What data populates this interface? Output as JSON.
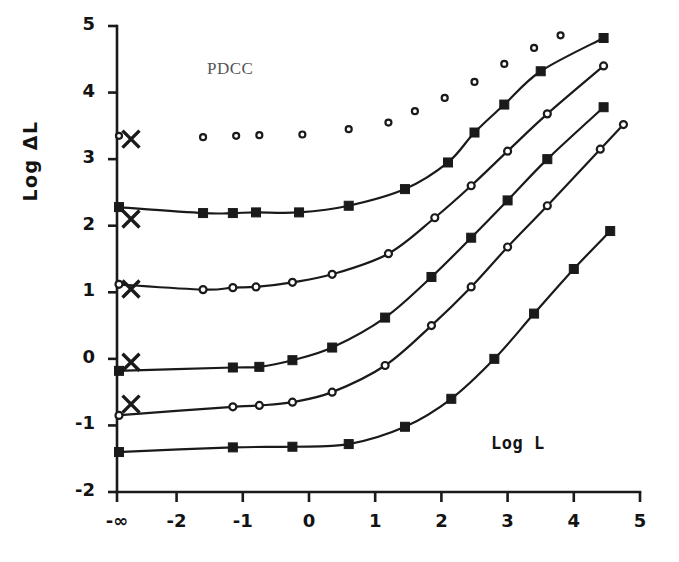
{
  "chart_data": {
    "type": "scatter",
    "title": "",
    "annotations": [
      {
        "text": "PDCC",
        "x": -1.45,
        "y": 4.33
      }
    ],
    "xlabel": "Log L",
    "ylabel": "Log ΔL",
    "xlim": [
      -2.9,
      5.0
    ],
    "ylim": [
      -2.0,
      5.0
    ],
    "grid": false,
    "legend": null,
    "x_tick_labels": [
      "-∞",
      "-2",
      "-1",
      "0",
      "1",
      "2",
      "3",
      "4",
      "5"
    ],
    "x_tick_values": [
      -2.9,
      -2,
      -1,
      0,
      1,
      2,
      3,
      4,
      5
    ],
    "y_tick_labels": [
      "5",
      "4",
      "3",
      "2",
      "1",
      "0",
      "-1",
      "-2"
    ],
    "y_tick_values": [
      5,
      4,
      3,
      2,
      1,
      0,
      -1,
      -2
    ],
    "axis_break_note": "leftmost x position denotes dark-adapted (-infinity) condition",
    "series": [
      {
        "name": "curve-1",
        "marker": "open-circle",
        "marker_size": 6,
        "has_fit_line": false,
        "dark_threshold": 3.35,
        "dark_marker": "open-circle",
        "x_marker_y": 3.3,
        "points": [
          {
            "x": -1.6,
            "y": 3.33
          },
          {
            "x": -1.1,
            "y": 3.35
          },
          {
            "x": -0.75,
            "y": 3.36
          },
          {
            "x": -0.1,
            "y": 3.37
          },
          {
            "x": 0.6,
            "y": 3.45
          },
          {
            "x": 1.2,
            "y": 3.55
          },
          {
            "x": 1.6,
            "y": 3.72
          },
          {
            "x": 2.05,
            "y": 3.92
          },
          {
            "x": 2.5,
            "y": 4.16
          },
          {
            "x": 2.95,
            "y": 4.43
          },
          {
            "x": 3.4,
            "y": 4.67
          },
          {
            "x": 3.8,
            "y": 4.86
          }
        ]
      },
      {
        "name": "curve-2",
        "marker": "filled-square",
        "marker_size": 9,
        "has_fit_line": true,
        "dark_threshold": 2.28,
        "dark_marker": "filled-square",
        "x_marker_y": 2.1,
        "points": [
          {
            "x": -1.6,
            "y": 2.19
          },
          {
            "x": -1.15,
            "y": 2.19
          },
          {
            "x": -0.8,
            "y": 2.2
          },
          {
            "x": -0.15,
            "y": 2.2
          },
          {
            "x": 0.6,
            "y": 2.3
          },
          {
            "x": 1.45,
            "y": 2.55
          },
          {
            "x": 2.1,
            "y": 2.95
          },
          {
            "x": 2.5,
            "y": 3.4
          },
          {
            "x": 2.95,
            "y": 3.82
          },
          {
            "x": 3.5,
            "y": 4.32
          },
          {
            "x": 4.45,
            "y": 4.82
          }
        ]
      },
      {
        "name": "curve-3",
        "marker": "open-circle",
        "marker_size": 7,
        "has_fit_line": true,
        "dark_threshold": 1.12,
        "dark_marker": "open-circle",
        "x_marker_y": 1.05,
        "points": [
          {
            "x": -1.6,
            "y": 1.04
          },
          {
            "x": -1.15,
            "y": 1.07
          },
          {
            "x": -0.8,
            "y": 1.08
          },
          {
            "x": -0.25,
            "y": 1.15
          },
          {
            "x": 0.35,
            "y": 1.27
          },
          {
            "x": 1.2,
            "y": 1.58
          },
          {
            "x": 1.9,
            "y": 2.12
          },
          {
            "x": 2.45,
            "y": 2.6
          },
          {
            "x": 3.0,
            "y": 3.12
          },
          {
            "x": 3.6,
            "y": 3.68
          },
          {
            "x": 4.45,
            "y": 4.4
          }
        ]
      },
      {
        "name": "curve-4",
        "marker": "filled-square",
        "marker_size": 9,
        "has_fit_line": true,
        "dark_threshold": -0.18,
        "dark_marker": "filled-square",
        "x_marker_y": -0.05,
        "points": [
          {
            "x": -1.15,
            "y": -0.13
          },
          {
            "x": -0.75,
            "y": -0.12
          },
          {
            "x": -0.25,
            "y": -0.02
          },
          {
            "x": 0.35,
            "y": 0.17
          },
          {
            "x": 1.15,
            "y": 0.62
          },
          {
            "x": 1.85,
            "y": 1.23
          },
          {
            "x": 2.45,
            "y": 1.82
          },
          {
            "x": 3.0,
            "y": 2.38
          },
          {
            "x": 3.6,
            "y": 3.0
          },
          {
            "x": 4.45,
            "y": 3.78
          }
        ]
      },
      {
        "name": "curve-5",
        "marker": "open-circle",
        "marker_size": 7,
        "has_fit_line": true,
        "dark_threshold": -0.85,
        "dark_marker": "open-circle",
        "x_marker_y": -0.68,
        "points": [
          {
            "x": -1.15,
            "y": -0.72
          },
          {
            "x": -0.75,
            "y": -0.7
          },
          {
            "x": -0.25,
            "y": -0.65
          },
          {
            "x": 0.35,
            "y": -0.5
          },
          {
            "x": 1.15,
            "y": -0.1
          },
          {
            "x": 1.85,
            "y": 0.5
          },
          {
            "x": 2.45,
            "y": 1.08
          },
          {
            "x": 3.0,
            "y": 1.68
          },
          {
            "x": 3.6,
            "y": 2.3
          },
          {
            "x": 4.4,
            "y": 3.15
          },
          {
            "x": 4.75,
            "y": 3.52
          }
        ]
      },
      {
        "name": "curve-6",
        "marker": "filled-square",
        "marker_size": 9,
        "has_fit_line": true,
        "dark_threshold": -1.4,
        "dark_marker": "filled-square",
        "x_marker_y": null,
        "points": [
          {
            "x": -1.15,
            "y": -1.33
          },
          {
            "x": -0.25,
            "y": -1.32
          },
          {
            "x": 0.6,
            "y": -1.28
          },
          {
            "x": 1.45,
            "y": -1.02
          },
          {
            "x": 2.15,
            "y": -0.6
          },
          {
            "x": 2.8,
            "y": 0.0
          },
          {
            "x": 3.4,
            "y": 0.68
          },
          {
            "x": 4.0,
            "y": 1.35
          },
          {
            "x": 4.55,
            "y": 1.92
          }
        ]
      }
    ],
    "colors": {
      "axis": "#1a1a1a",
      "marker": "#1a1a1a",
      "line": "#1a1a1a",
      "annotation": "#555555"
    }
  }
}
